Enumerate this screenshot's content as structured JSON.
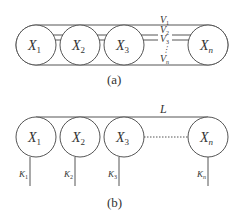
{
  "figure_a": {
    "caption": "(a)",
    "nodes": [
      {
        "label": "X",
        "sub": "1"
      },
      {
        "label": "X",
        "sub": "2"
      },
      {
        "label": "X",
        "sub": "3"
      },
      {
        "label": "X",
        "sub": "n"
      }
    ],
    "lines": [
      {
        "label": "V",
        "sub": "1"
      },
      {
        "label": "V",
        "sub": "2"
      },
      {
        "label": "V",
        "sub": "3"
      },
      {
        "label": "V",
        "sub": "n"
      }
    ],
    "ellipsis": "⋮"
  },
  "figure_b": {
    "caption": "(b)",
    "top_line_label": "L",
    "nodes": [
      {
        "label": "X",
        "sub": "1",
        "k": "K",
        "ksub": "1"
      },
      {
        "label": "X",
        "sub": "2",
        "k": "K",
        "ksub": "2"
      },
      {
        "label": "X",
        "sub": "3",
        "k": "K",
        "ksub": "3"
      },
      {
        "label": "X",
        "sub": "n",
        "k": "K",
        "ksub": "n"
      }
    ]
  }
}
